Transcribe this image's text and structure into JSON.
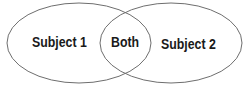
{
  "diagram": {
    "type": "venn",
    "sets": [
      {
        "id": "left",
        "label": "Subject 1"
      },
      {
        "id": "right",
        "label": "Subject 2"
      }
    ],
    "intersection": {
      "label": "Both"
    },
    "colors": {
      "stroke": "#6e6e6e",
      "fill": "#ffffff",
      "text": "#1a1a1a"
    }
  }
}
